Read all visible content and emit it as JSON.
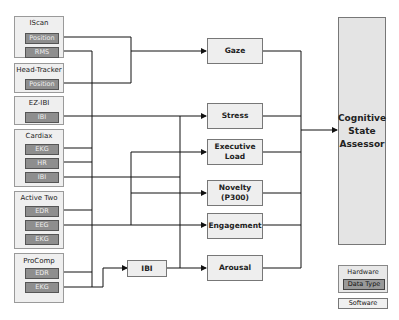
{
  "hardware": [
    {
      "name": "IScan",
      "data_types": [
        "Position",
        "RMS"
      ]
    },
    {
      "name": "Head-Tracker",
      "data_types": [
        "Position"
      ]
    },
    {
      "name": "EZ-IBI",
      "data_types": [
        "IBI"
      ]
    },
    {
      "name": "Cardiax",
      "data_types": [
        "EKG",
        "HR",
        "IBI"
      ]
    },
    {
      "name": "Active Two",
      "data_types": [
        "EDR",
        "EEG",
        "EKG"
      ]
    },
    {
      "name": "ProComp",
      "data_types": [
        "EDR",
        "EKG"
      ]
    }
  ],
  "software": {
    "ibi": "IBI",
    "gaze": "Gaze",
    "stress": "Stress",
    "executive_load": "Executive Load",
    "novelty": "Novelty (P300)",
    "engagement": "Engagement",
    "arousal": "Arousal"
  },
  "assessor": "Cognitive State Assessor",
  "legend": {
    "hardware": "Hardware",
    "data_type": "Data Type",
    "software": "Software"
  }
}
